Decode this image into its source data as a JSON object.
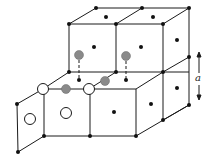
{
  "figure": {
    "dimension_label": "a",
    "colors": {
      "line": "#1a1a1a",
      "lattice_atom": "#111111",
      "adatom_gray": "#8a8a8a",
      "vacancy_open": "#ffffff"
    }
  },
  "lines": [
    [
      96,
      8,
      189,
      8
    ],
    [
      69,
      24,
      163,
      24
    ],
    [
      69,
      24,
      96,
      8
    ],
    [
      116,
      24,
      142,
      8
    ],
    [
      163,
      24,
      189,
      8
    ],
    [
      69,
      24,
      69,
      72
    ],
    [
      116,
      24,
      116,
      72
    ],
    [
      163,
      24,
      163,
      72
    ],
    [
      189,
      8,
      189,
      105
    ],
    [
      69,
      72,
      189,
      72
    ],
    [
      163,
      72,
      189,
      57
    ],
    [
      43,
      89,
      69,
      72
    ],
    [
      89,
      89,
      116,
      72
    ],
    [
      136,
      89,
      163,
      72
    ],
    [
      43,
      89,
      136,
      89
    ],
    [
      44,
      89,
      44,
      136
    ],
    [
      90,
      89,
      90,
      136
    ],
    [
      136,
      89,
      136,
      136
    ],
    [
      163,
      72,
      163,
      120
    ],
    [
      44,
      136,
      136,
      136
    ],
    [
      136,
      136,
      189,
      105
    ],
    [
      163,
      120,
      189,
      105
    ],
    [
      17,
      104,
      43,
      89
    ],
    [
      17,
      104,
      18,
      152
    ],
    [
      18,
      152,
      44,
      136
    ]
  ],
  "dashed_lines": [
    [
      79,
      60,
      79,
      80
    ],
    [
      126,
      61,
      126,
      80
    ]
  ],
  "black_atoms": [
    [
      96,
      8
    ],
    [
      142,
      8
    ],
    [
      189,
      8
    ],
    [
      69,
      24
    ],
    [
      116,
      24
    ],
    [
      163,
      24
    ],
    [
      106,
      17
    ],
    [
      153,
      17
    ],
    [
      94,
      47
    ],
    [
      141,
      47
    ],
    [
      177,
      40
    ],
    [
      69,
      72
    ],
    [
      116,
      72
    ],
    [
      163,
      72
    ],
    [
      189,
      57
    ],
    [
      79,
      80
    ],
    [
      126,
      80
    ],
    [
      114,
      112
    ],
    [
      151,
      104
    ],
    [
      177,
      88
    ],
    [
      44,
      136
    ],
    [
      90,
      136
    ],
    [
      136,
      136
    ],
    [
      163,
      120
    ],
    [
      189,
      105
    ],
    [
      17,
      104
    ],
    [
      18,
      152
    ]
  ],
  "gray_atoms": [
    [
      79,
      55
    ],
    [
      126,
      56
    ],
    [
      66,
      89
    ],
    [
      105,
      81
    ]
  ],
  "open_atoms": [
    [
      43,
      89
    ],
    [
      89,
      89
    ],
    [
      66,
      113
    ],
    [
      30,
      119
    ]
  ],
  "arrow": {
    "x": 199,
    "y_top": 52,
    "y_bottom": 100,
    "label_x": 195,
    "label_y": 81
  }
}
